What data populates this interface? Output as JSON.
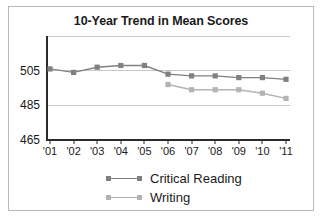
{
  "chart_data": {
    "type": "line",
    "title": "10-Year Trend in Mean Scores",
    "xlabel": "",
    "ylabel": "",
    "x": [
      "'01",
      "'02",
      "'03",
      "'04",
      "'05",
      "'06",
      "'07",
      "'08",
      "'09",
      "'10",
      "'11"
    ],
    "categories": [
      "'01",
      "'02",
      "'03",
      "'04",
      "'05",
      "'06",
      "'07",
      "'08",
      "'09",
      "'10",
      "'11"
    ],
    "ylim": [
      465,
      525
    ],
    "yticks": [
      465,
      485,
      505
    ],
    "ytick_labels": [
      "465",
      "485",
      "505"
    ],
    "gridlines": [
      465,
      485,
      505,
      525
    ],
    "grid": true,
    "legend_position": "bottom",
    "series": [
      {
        "name": "Critical Reading",
        "color": "#808080",
        "values": [
          506,
          504,
          507,
          508,
          508,
          503,
          502,
          502,
          501,
          501,
          500
        ]
      },
      {
        "name": "Writing",
        "color": "#b3b3b3",
        "values": [
          null,
          null,
          null,
          null,
          null,
          497,
          494,
          494,
          494,
          492,
          489
        ]
      }
    ]
  },
  "legend": {
    "items": [
      {
        "label": "Critical Reading",
        "color": "#808080"
      },
      {
        "label": "Writing",
        "color": "#b3b3b3"
      }
    ]
  },
  "axis": {
    "y_tick_labels": [
      "505",
      "485",
      "465"
    ],
    "x_tick_labels": [
      "'01",
      "'02",
      "'03",
      "'04",
      "'05",
      "'06",
      "'07",
      "'08",
      "'09",
      "'10",
      "'11"
    ]
  },
  "colors": {
    "critical_reading": "#808080",
    "writing": "#b3b3b3",
    "grid": "#c8c8c8",
    "axis": "#2b2b2b",
    "frame": "#b9b9b9",
    "text": "#1a1a1a"
  }
}
